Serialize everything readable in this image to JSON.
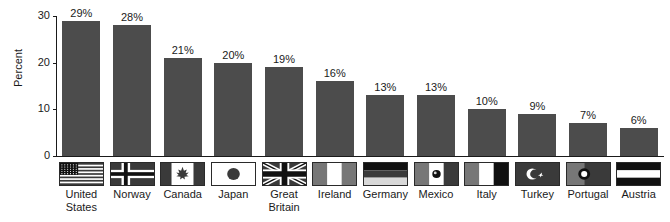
{
  "chart_data": {
    "type": "bar",
    "title": "",
    "subtitle": "",
    "xlabel": "",
    "ylabel": "Percent",
    "ylim": [
      0,
      30
    ],
    "yticks": [
      0,
      10,
      20,
      30
    ],
    "ytick_labels": [
      "0",
      "10",
      "20",
      "30"
    ],
    "grid": false,
    "legend": "none",
    "categories": [
      "United States",
      "Norway",
      "Canada",
      "Japan",
      "Great Britain",
      "Ireland",
      "Germany",
      "Mexico",
      "Italy",
      "Turkey",
      "Portugal",
      "Austria"
    ],
    "values": [
      29,
      28,
      21,
      20,
      19,
      16,
      13,
      13,
      10,
      9,
      7,
      6
    ],
    "data_labels": [
      "29%",
      "28%",
      "21%",
      "20%",
      "19%",
      "16%",
      "13%",
      "13%",
      "10%",
      "9%",
      "7%",
      "6%"
    ],
    "bar_color": "#4c4c4c",
    "axis_color": "#1a1a1a",
    "background_color": "#ffffff"
  },
  "axis": {
    "y_title": "Percent",
    "ticks": [
      {
        "label": "30",
        "value": 30
      },
      {
        "label": "20",
        "value": 20
      },
      {
        "label": "10",
        "value": 10
      },
      {
        "label": "0",
        "value": 0
      }
    ]
  },
  "bars": [
    {
      "country": "United States",
      "label_line1": "United",
      "label_line2": "States",
      "value": 29,
      "data_label": "29%",
      "flag": "flag-united-states"
    },
    {
      "country": "Norway",
      "label_line1": "Norway",
      "label_line2": "",
      "value": 28,
      "data_label": "28%",
      "flag": "flag-norway"
    },
    {
      "country": "Canada",
      "label_line1": "Canada",
      "label_line2": "",
      "value": 21,
      "data_label": "21%",
      "flag": "flag-canada"
    },
    {
      "country": "Japan",
      "label_line1": "Japan",
      "label_line2": "",
      "value": 20,
      "data_label": "20%",
      "flag": "flag-japan"
    },
    {
      "country": "Great Britain",
      "label_line1": "Great",
      "label_line2": "Britain",
      "value": 19,
      "data_label": "19%",
      "flag": "flag-great-britain"
    },
    {
      "country": "Ireland",
      "label_line1": "Ireland",
      "label_line2": "",
      "value": 16,
      "data_label": "16%",
      "flag": "flag-ireland"
    },
    {
      "country": "Germany",
      "label_line1": "Germany",
      "label_line2": "",
      "value": 13,
      "data_label": "13%",
      "flag": "flag-germany"
    },
    {
      "country": "Mexico",
      "label_line1": "Mexico",
      "label_line2": "",
      "value": 13,
      "data_label": "13%",
      "flag": "flag-mexico"
    },
    {
      "country": "Italy",
      "label_line1": "Italy",
      "label_line2": "",
      "value": 10,
      "data_label": "10%",
      "flag": "flag-italy"
    },
    {
      "country": "Turkey",
      "label_line1": "Turkey",
      "label_line2": "",
      "value": 9,
      "data_label": "9%",
      "flag": "flag-turkey"
    },
    {
      "country": "Portugal",
      "label_line1": "Portugal",
      "label_line2": "",
      "value": 7,
      "data_label": "7%",
      "flag": "flag-portugal"
    },
    {
      "country": "Austria",
      "label_line1": "Austria",
      "label_line2": "",
      "value": 6,
      "data_label": "6%",
      "flag": "flag-austria"
    }
  ]
}
